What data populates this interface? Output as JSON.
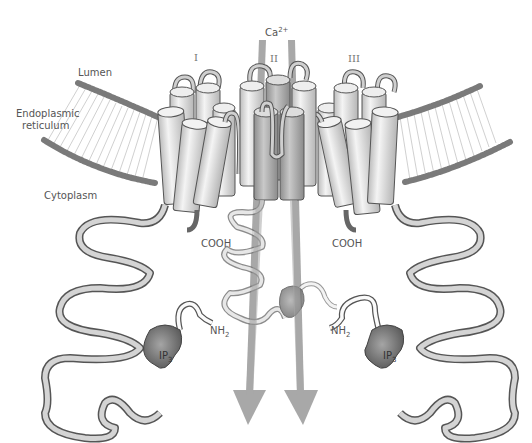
{
  "figure": {
    "labels": {
      "lumen": "Lumen",
      "er_line1": "Endoplasmic",
      "er_line2": "reticulum",
      "cytoplasm": "Cytoplasm",
      "ion": "Ca",
      "ion_charge": "2+",
      "subunit_1": "I",
      "subunit_2": "II",
      "subunit_3": "III",
      "cooh_left": "COOH",
      "cooh_right": "COOH",
      "nh2_left": "NH",
      "nh2_left_sub": "2",
      "nh2_right": "NH",
      "nh2_right_sub": "2",
      "ip3_left": "IP",
      "ip3_left_sub": "3",
      "ip3_right": "IP",
      "ip3_right_sub": "3"
    },
    "colors": {
      "background": "#ffffff",
      "lipid_head": "#7a7a7a",
      "lipid_tail": "#bdbdbd",
      "helix_fill": "#e6e6e6",
      "helix_stroke": "#555555",
      "loop_fill": "#cfcfcf",
      "ip3": "#6e6e6e",
      "arrow": "#a8a8a8",
      "text": "#555555"
    }
  }
}
